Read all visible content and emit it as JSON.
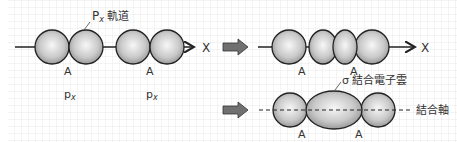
{
  "diagram": {
    "colors": {
      "grid": "#d8d8d8",
      "orbital_fill_light": "#f4f4f4",
      "orbital_fill_dark": "#9a9a9a",
      "outline": "#222222",
      "arrow": "#6e6e6e"
    },
    "left_panel": {
      "orbital_label_prefix": "P",
      "orbital_label_sub": "x",
      "orbital_label_suffix": " 軌道",
      "axis_label": "X",
      "atom_labels": [
        "A",
        "A"
      ],
      "orbital_names": [
        {
          "base": "p",
          "sub": "x"
        },
        {
          "base": "p",
          "sub": "x"
        }
      ]
    },
    "right_top": {
      "axis_label": "X",
      "atom_labels": [
        "A",
        "A"
      ]
    },
    "right_bottom": {
      "cloud_label": "σ 結合電子雲",
      "axis_label": "結合軸",
      "atom_labels": [
        "A",
        "A"
      ]
    }
  }
}
